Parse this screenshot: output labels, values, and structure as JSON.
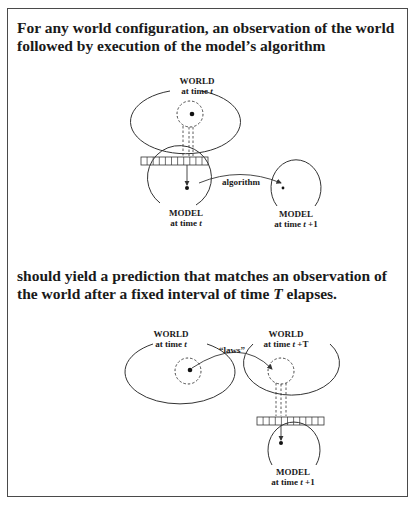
{
  "captions": {
    "top": "For any world configuration, an observation of the world followed by execution of the model’s algorithm",
    "bottom_pre": "should yield a prediction that matches an observation of the world after a fixed interval of time ",
    "bottom_var": "T",
    "bottom_post": " elapses."
  },
  "top_diagram": {
    "world": {
      "title": "WORLD",
      "time_prefix": "at time ",
      "time_var": "t"
    },
    "model_left": {
      "title": "MODEL",
      "time_prefix": "at time ",
      "time_var": "t"
    },
    "model_right": {
      "title": "MODEL",
      "time_prefix": "at time ",
      "time_var": "t",
      "time_suffix": " +1"
    },
    "arrow_label": "algorithm",
    "register_cells": 11
  },
  "bottom_diagram": {
    "world_left": {
      "title": "WORLD",
      "time_prefix": "at time ",
      "time_var": "t"
    },
    "world_right": {
      "title": "WORLD",
      "time_prefix": "at time ",
      "time_var": "t",
      "time_suffix": " +T"
    },
    "model": {
      "title": "MODEL",
      "time_prefix": "at time ",
      "time_var": "t",
      "time_suffix": " +1"
    },
    "arrow_label": "“laws”",
    "register_cells": 11
  },
  "colors": {
    "stroke": "#333333",
    "text": "#1a1a1a",
    "border": "#4a4a4a"
  }
}
